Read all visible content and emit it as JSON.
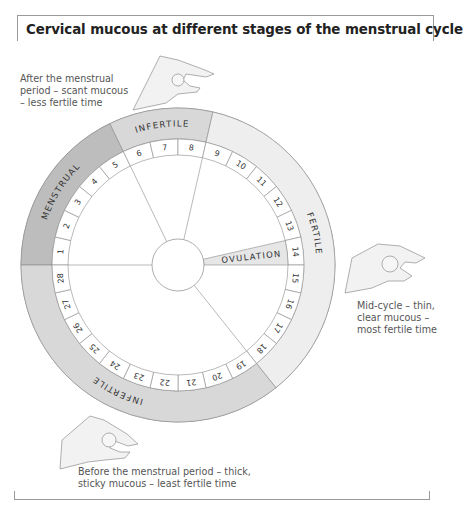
{
  "title": "Cervical mucous at different stages of the menstrual cycle",
  "captions": {
    "after": "After the menstrual period – scant mucous – less fertile time",
    "mid": "Mid-cycle – thin, clear mucous – most fertile time",
    "before": "Before the menstrual period – thick, sticky mucous – least fertile time"
  },
  "wheel": {
    "center": [
      178,
      265
    ],
    "outer_radius": 157,
    "day_ring_outer": 126,
    "day_ring_inner": 110,
    "hub_radius": 26,
    "days": 28,
    "start_angle_deg": 180,
    "zones": [
      {
        "label": "MENSTRUAL",
        "from_day": 1,
        "to_day": 5,
        "color": "#bdbdbd"
      },
      {
        "label": "INFERTILE",
        "from_day": 6,
        "to_day": 8,
        "color": "#d8d8d8"
      },
      {
        "label": "FERTILE",
        "from_day": 9,
        "to_day": 18,
        "color": "#eeeeee"
      },
      {
        "label": "INFERTILE",
        "from_day": 19,
        "to_day": 28,
        "color": "#d8d8d8"
      }
    ],
    "ovulation": {
      "label": "OVULATION",
      "day": 14,
      "color": "#e6e6e6"
    },
    "line_color": "#8a8a8a"
  },
  "chart_data": {
    "type": "pie",
    "title": "Cervical mucous at different stages of the menstrual cycle",
    "categories": [
      "Menstrual (days 1–5)",
      "Infertile (days 6–8)",
      "Fertile (days 9–18)",
      "Infertile (days 19–28)"
    ],
    "values": [
      5,
      3,
      10,
      10
    ],
    "day_labels": [
      "1",
      "2",
      "3",
      "4",
      "5",
      "6",
      "7",
      "8",
      "9",
      "10",
      "11",
      "12",
      "13",
      "14",
      "15",
      "16",
      "17",
      "18",
      "19",
      "20",
      "21",
      "22",
      "23",
      "24",
      "25",
      "26",
      "27",
      "28"
    ],
    "annotations": [
      "OVULATION at day 14"
    ]
  }
}
